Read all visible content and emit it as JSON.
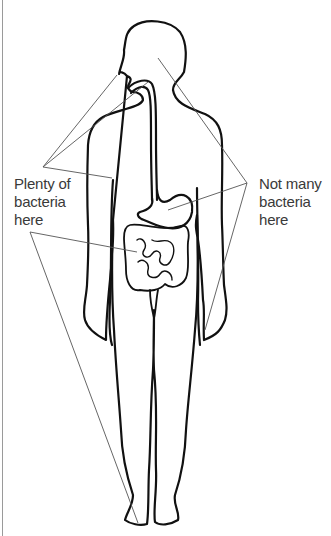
{
  "diagram": {
    "type": "labeled body outline with digestive tract",
    "labels": {
      "plenty": {
        "lines": [
          "Plenty of",
          "bacteria",
          "here"
        ],
        "points_to": [
          "mouth",
          "throat",
          "large intestine",
          "skin of foot"
        ]
      },
      "not_many": {
        "lines": [
          "Not many",
          "bacteria",
          "here"
        ],
        "points_to": [
          "nasal cavity / back of throat",
          "stomach",
          "arm skin"
        ]
      }
    },
    "colors": {
      "outline": "#111111",
      "pointer": "#555555",
      "text": "#3a3a3a",
      "border": "#9a9a9a"
    }
  }
}
